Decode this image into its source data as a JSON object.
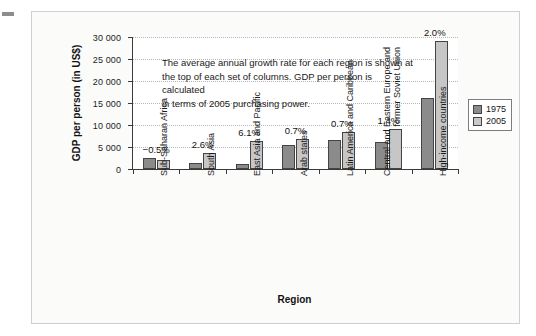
{
  "chart_data": {
    "type": "bar",
    "title": "",
    "xlabel": "Region",
    "ylabel": "GDP per person (in US$)",
    "ylim": [
      0,
      30000
    ],
    "ytick_labels": [
      "0",
      "5 000",
      "10 000",
      "15 000",
      "20 000",
      "25 000",
      "30 000"
    ],
    "ytick_values": [
      0,
      5000,
      10000,
      15000,
      20000,
      25000,
      30000
    ],
    "grid": true,
    "legend_position": "right",
    "categories": [
      "Sub-Saharan Africa",
      "South Asia",
      "East Asia and Pacific",
      "Arab states",
      "Latin America and Caribbean",
      "Central and Eastern Europe and|former Soviet Union",
      "High-income countries"
    ],
    "series": [
      {
        "name": "1975",
        "color": "#8b8b8b",
        "values": [
          2400,
          1300,
          1100,
          5400,
          6700,
          6200,
          16100
        ]
      },
      {
        "name": "2005",
        "color": "#c6c6c6",
        "values": [
          2000,
          3600,
          6400,
          6800,
          8300,
          9200,
          29000
        ]
      }
    ],
    "annotations": {
      "growth_rates": [
        "−0.5%",
        "2.6%",
        "6.1%",
        "0.7%",
        "0.7%",
        "1.4%",
        "2.0%"
      ],
      "note": "The average annual growth rate for each region is shown at the top of each set of columns. GDP per person is calculated in terms of 2005 purchasing power."
    }
  },
  "axes": {
    "y_title": "GDP per person (in US$)",
    "x_title": "Region",
    "y_ticks": [
      {
        "label": "30 000",
        "value": 30000
      },
      {
        "label": "25 000",
        "value": 25000
      },
      {
        "label": "20 000",
        "value": 20000
      },
      {
        "label": "15 000",
        "value": 15000
      },
      {
        "label": "10 000",
        "value": 10000
      },
      {
        "label": "5 000",
        "value": 5000
      },
      {
        "label": "0",
        "value": 0
      }
    ]
  },
  "categories": [
    {
      "line1": "Sub-Saharan Africa",
      "line2": ""
    },
    {
      "line1": "South Asia",
      "line2": ""
    },
    {
      "line1": "East Asia and Pacific",
      "line2": ""
    },
    {
      "line1": "Arab states",
      "line2": ""
    },
    {
      "line1": "Latin America and Caribbean",
      "line2": ""
    },
    {
      "line1": "Central and Eastern Europe and",
      "line2": "former Soviet Union"
    },
    {
      "line1": "High-income countries",
      "line2": ""
    }
  ],
  "growth_labels": [
    "−0.5%",
    "2.6%",
    "6.1%",
    "0.7%",
    "0.7%",
    "1.4%",
    "2.0%"
  ],
  "annotation": {
    "line1": "The average annual growth rate for each region is shown at",
    "line2": "the top of each set of columns. GDP per person is calculated",
    "line3": "in terms of 2005 purchasing power."
  },
  "legend": {
    "items": [
      {
        "label": "1975",
        "color": "#8b8b8b"
      },
      {
        "label": "2005",
        "color": "#c6c6c6"
      }
    ]
  }
}
